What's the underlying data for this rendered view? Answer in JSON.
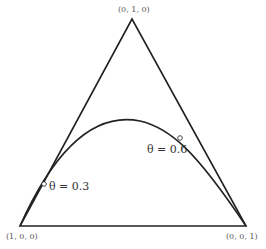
{
  "diagram": {
    "type": "simplex",
    "stroke_color": "#222222",
    "background": "#ffffff",
    "vertices": {
      "top": "(0, 1, 0)",
      "bottom_left": "(1, 0, 0)",
      "bottom_right": "(0, 0, 1)"
    },
    "curve": {
      "description": "curve from (1,0,0) to (0,0,1) through the simplex interior",
      "markers": [
        {
          "label": "θ = 0.3"
        },
        {
          "label": "θ = 0.6"
        }
      ]
    }
  }
}
